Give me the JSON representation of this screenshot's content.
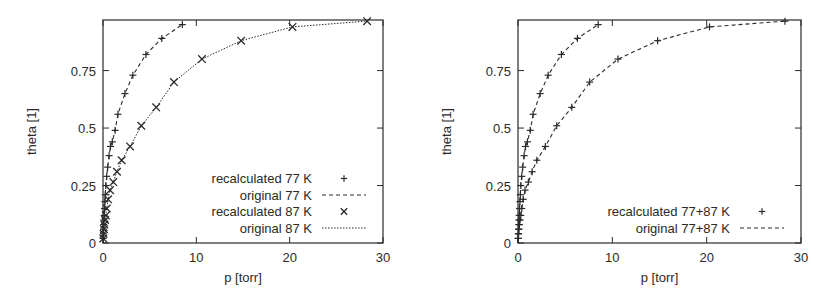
{
  "chart_data": [
    {
      "type": "line",
      "panel": "left",
      "xlabel": "p [torr]",
      "ylabel": "theta [1]",
      "xlim": [
        0,
        30
      ],
      "ylim": [
        0,
        0.97
      ],
      "xticks": [
        0,
        10,
        20,
        30
      ],
      "xtick_labels": [
        "0",
        "10",
        "20",
        "30"
      ],
      "yticks": [
        0,
        0.25,
        0.5,
        0.75
      ],
      "ytick_labels": [
        "0",
        "0.25",
        "0.5",
        "0.75"
      ],
      "grid": false,
      "legend_position": "bottom-right",
      "series": [
        {
          "name": "recalculated 77 K",
          "style": "points",
          "marker": "plus",
          "x": [
            0.02,
            0.04,
            0.06,
            0.08,
            0.1,
            0.13,
            0.16,
            0.2,
            0.25,
            0.3,
            0.4,
            0.5,
            0.65,
            0.8,
            1.0,
            1.3,
            1.6,
            2.35,
            3.2,
            4.6,
            6.3,
            8.5
          ],
          "y": [
            0.02,
            0.04,
            0.06,
            0.08,
            0.1,
            0.12,
            0.15,
            0.18,
            0.21,
            0.25,
            0.29,
            0.33,
            0.38,
            0.42,
            0.44,
            0.49,
            0.56,
            0.65,
            0.73,
            0.82,
            0.89,
            0.95
          ]
        },
        {
          "name": "original 77 K",
          "style": "dashed-line",
          "x": [
            0.0,
            0.02,
            0.04,
            0.06,
            0.08,
            0.1,
            0.13,
            0.16,
            0.2,
            0.25,
            0.3,
            0.4,
            0.5,
            0.65,
            0.8,
            1.0,
            1.3,
            1.6,
            2.35,
            3.2,
            4.6,
            6.3,
            8.5
          ],
          "y": [
            0.0,
            0.02,
            0.04,
            0.06,
            0.08,
            0.1,
            0.12,
            0.15,
            0.18,
            0.21,
            0.25,
            0.29,
            0.33,
            0.38,
            0.42,
            0.44,
            0.49,
            0.56,
            0.65,
            0.73,
            0.82,
            0.89,
            0.95
          ]
        },
        {
          "name": "recalculated 87 K",
          "style": "points",
          "marker": "cross",
          "x": [
            0.03,
            0.06,
            0.1,
            0.15,
            0.22,
            0.3,
            0.4,
            0.55,
            0.75,
            1.1,
            1.5,
            2.0,
            2.9,
            4.1,
            5.7,
            7.6,
            10.6,
            14.8,
            20.3,
            28.3
          ],
          "y": [
            0.02,
            0.04,
            0.06,
            0.08,
            0.1,
            0.12,
            0.15,
            0.19,
            0.23,
            0.265,
            0.31,
            0.36,
            0.42,
            0.51,
            0.59,
            0.7,
            0.8,
            0.88,
            0.94,
            0.965
          ]
        },
        {
          "name": "original 87 K",
          "style": "dotted-line",
          "x": [
            0.0,
            0.03,
            0.06,
            0.1,
            0.15,
            0.22,
            0.3,
            0.4,
            0.55,
            0.75,
            1.1,
            1.5,
            2.0,
            2.9,
            4.1,
            5.7,
            7.6,
            10.6,
            14.8,
            20.3,
            28.3
          ],
          "y": [
            0.0,
            0.02,
            0.04,
            0.06,
            0.08,
            0.1,
            0.12,
            0.15,
            0.19,
            0.23,
            0.265,
            0.31,
            0.36,
            0.42,
            0.51,
            0.59,
            0.7,
            0.8,
            0.88,
            0.94,
            0.965
          ]
        }
      ]
    },
    {
      "type": "line",
      "panel": "right",
      "xlabel": "p [torr]",
      "ylabel": "theta [1]",
      "xlim": [
        0,
        30
      ],
      "ylim": [
        0,
        0.97
      ],
      "xticks": [
        0,
        10,
        20,
        30
      ],
      "xtick_labels": [
        "0",
        "10",
        "20",
        "30"
      ],
      "yticks": [
        0,
        0.25,
        0.5,
        0.75
      ],
      "ytick_labels": [
        "0",
        "0.25",
        "0.5",
        "0.75"
      ],
      "grid": false,
      "legend_position": "bottom-right",
      "series": [
        {
          "name": "recalculated 77+87 K",
          "style": "points",
          "marker": "plus",
          "x": [
            0.02,
            0.04,
            0.06,
            0.08,
            0.1,
            0.13,
            0.16,
            0.2,
            0.25,
            0.3,
            0.4,
            0.5,
            0.65,
            0.8,
            1.0,
            1.3,
            1.6,
            2.35,
            3.2,
            4.6,
            6.3,
            8.5,
            0.03,
            0.06,
            0.1,
            0.15,
            0.22,
            0.3,
            0.4,
            0.55,
            0.75,
            1.1,
            1.5,
            2.0,
            2.9,
            4.1,
            5.7,
            7.6,
            10.6,
            14.8,
            20.3,
            28.3
          ],
          "y": [
            0.02,
            0.04,
            0.06,
            0.08,
            0.1,
            0.12,
            0.15,
            0.18,
            0.21,
            0.25,
            0.29,
            0.33,
            0.38,
            0.42,
            0.44,
            0.49,
            0.56,
            0.65,
            0.73,
            0.82,
            0.89,
            0.95,
            0.02,
            0.04,
            0.06,
            0.08,
            0.1,
            0.12,
            0.15,
            0.19,
            0.23,
            0.265,
            0.31,
            0.36,
            0.42,
            0.51,
            0.59,
            0.7,
            0.8,
            0.88,
            0.94,
            0.965
          ]
        },
        {
          "name": "original 77+87 K",
          "style": "dashed-line",
          "segments": [
            {
              "x": [
                0.0,
                0.02,
                0.04,
                0.06,
                0.08,
                0.1,
                0.13,
                0.16,
                0.2,
                0.25,
                0.3,
                0.4,
                0.5,
                0.65,
                0.8,
                1.0,
                1.3,
                1.6,
                2.35,
                3.2,
                4.6,
                6.3,
                8.5
              ],
              "y": [
                0.0,
                0.02,
                0.04,
                0.06,
                0.08,
                0.1,
                0.12,
                0.15,
                0.18,
                0.21,
                0.25,
                0.29,
                0.33,
                0.38,
                0.42,
                0.44,
                0.49,
                0.56,
                0.65,
                0.73,
                0.82,
                0.89,
                0.95
              ]
            },
            {
              "x": [
                0.0,
                0.03,
                0.06,
                0.1,
                0.15,
                0.22,
                0.3,
                0.4,
                0.55,
                0.75,
                1.1,
                1.5,
                2.0,
                2.9,
                4.1,
                5.7,
                7.6,
                10.6,
                14.8,
                20.3,
                28.3
              ],
              "y": [
                0.0,
                0.02,
                0.04,
                0.06,
                0.08,
                0.1,
                0.12,
                0.15,
                0.19,
                0.23,
                0.265,
                0.31,
                0.36,
                0.42,
                0.51,
                0.59,
                0.7,
                0.8,
                0.88,
                0.94,
                0.965
              ]
            }
          ]
        }
      ]
    }
  ]
}
